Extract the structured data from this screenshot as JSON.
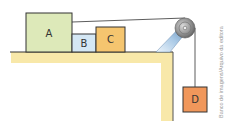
{
  "diagram": {
    "blocks": [
      {
        "id": "A",
        "label": "A",
        "color": "#dde9b9"
      },
      {
        "id": "B",
        "label": "B",
        "color": "#d4e7f4"
      },
      {
        "id": "C",
        "label": "C",
        "color": "#f5c56f"
      },
      {
        "id": "D",
        "label": "D",
        "color": "#f0975b"
      }
    ],
    "table_color": "#f8e8a9",
    "outline_color": "#333333",
    "pulley_color": "#9a9a9a",
    "support_color": "#a9c9e6",
    "credit": "Banco de imagens/Arquivo da editora"
  }
}
